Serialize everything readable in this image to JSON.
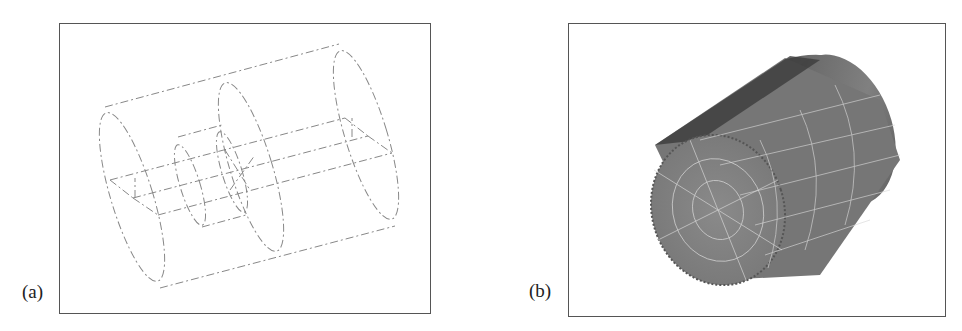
{
  "figure": {
    "panels": [
      {
        "id": "a",
        "label": "(a)",
        "content": "wireframe geometry of a cylinder with two end disks, a central disk, and an inner smaller cylinder (dash-dot lines)"
      },
      {
        "id": "b",
        "label": "(b)",
        "content": "shaded finite element mesh of a cylinder with quadrilateral grid lines on end face and curved surface"
      }
    ],
    "colors": {
      "wireframe": "#888888",
      "mesh_surface": "#7a7a7a",
      "mesh_top_dark": "#3a3a3a",
      "mesh_lines": "#d8d8d8",
      "frame": "#555555"
    }
  }
}
